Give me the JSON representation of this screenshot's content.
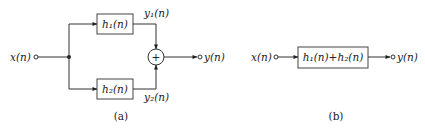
{
  "diagram_a": {
    "input_label": "x(n)",
    "block1_label": "h₁(n)",
    "block2_label": "h₂(n)",
    "branch1_output_label": "y₁(n)",
    "branch2_output_label": "y₂(n)",
    "summer_symbol": "+",
    "output_label": "y(n)",
    "caption": "(a)"
  },
  "diagram_b": {
    "input_label": "x(n)",
    "block_label": "h₁(n)+h₂(n)",
    "output_label": "y(n)",
    "caption": "(b)"
  },
  "colors": {
    "line": "#333333",
    "text": "#222222",
    "background": "#ffffff"
  }
}
